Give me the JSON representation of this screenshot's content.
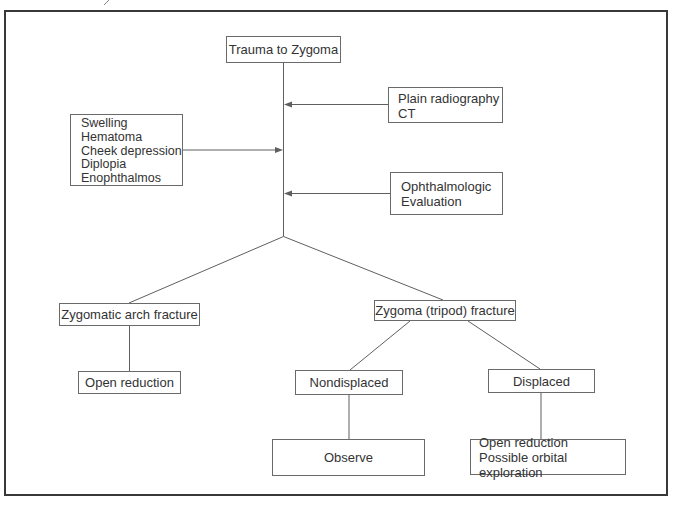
{
  "figure": {
    "nodes": {
      "trauma": "Trauma to Zygoma",
      "imaging": "Plain radiography\nCT",
      "clinical_signs": "Swelling\nHematoma\nCheek depression\nDiplopia\nEnophthalmos",
      "ophthalmologic": "Ophthalmologic\nEvaluation",
      "arch_fracture": "Zygomatic arch fracture",
      "arch_treatment": "Open reduction",
      "tripod_fracture": "Zygoma (tripod) fracture",
      "nondisplaced": "Nondisplaced",
      "displaced": "Displaced",
      "nondisplaced_treatment": "Observe",
      "displaced_treatment": "Open reduction\nPossible orbital exploration"
    },
    "colors": {
      "frame": "#383838",
      "box_border": "#6a6a6a",
      "edge": "#5f5f5f",
      "text": "#333333",
      "background": "#ffffff"
    }
  }
}
